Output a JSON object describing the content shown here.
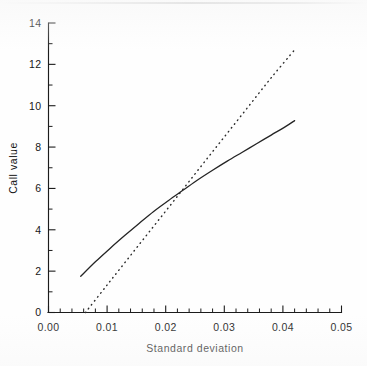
{
  "figure": {
    "background_color": "#fefefe",
    "ink_color": "#1c1c1c"
  },
  "chart_data": {
    "type": "line",
    "title": "",
    "xlabel": "Standard deviation",
    "ylabel": "Call value",
    "xlim": [
      0.0,
      0.05
    ],
    "ylim": [
      0,
      14
    ],
    "grid": false,
    "legend": "none",
    "x_major_ticks": [
      0.0,
      0.01,
      0.02,
      0.03,
      0.04,
      0.05
    ],
    "x_tick_labels": [
      "0.00",
      "0.01",
      "0.02",
      "0.03",
      "0.04",
      "0.05"
    ],
    "x_minor_ticks": [
      0.002,
      0.004,
      0.006,
      0.008,
      0.012,
      0.014,
      0.016,
      0.018,
      0.022,
      0.024,
      0.026,
      0.028,
      0.032,
      0.034,
      0.036,
      0.038,
      0.042,
      0.044,
      0.046,
      0.048
    ],
    "y_major_ticks": [
      0,
      2,
      4,
      6,
      8,
      10,
      12,
      14
    ],
    "y_tick_labels": [
      "0",
      "2",
      "4",
      "6",
      "8",
      "10",
      "12",
      "14"
    ],
    "y_minor_ticks": [
      1,
      3,
      5,
      7,
      9,
      11,
      13
    ],
    "series": [
      {
        "name": "solid-curve",
        "style": "solid",
        "color": "#242424",
        "x": [
          0.0055,
          0.008,
          0.0105,
          0.013,
          0.0155,
          0.018,
          0.0205,
          0.023,
          0.0255,
          0.028,
          0.0305,
          0.033,
          0.0355,
          0.038,
          0.0405,
          0.042
        ],
        "y": [
          1.75,
          2.45,
          3.1,
          3.72,
          4.32,
          4.9,
          5.42,
          5.92,
          6.42,
          6.88,
          7.32,
          7.74,
          8.16,
          8.58,
          9.0,
          9.28
        ]
      },
      {
        "name": "dotted-line",
        "style": "dotted",
        "color": "#2c2c2c",
        "x": [
          0.0063,
          0.01,
          0.014,
          0.018,
          0.022,
          0.026,
          0.03,
          0.034,
          0.038,
          0.042
        ],
        "y": [
          0.0,
          1.33,
          2.76,
          4.19,
          5.62,
          7.06,
          8.49,
          9.92,
          11.35,
          12.7
        ]
      }
    ],
    "annotations": [
      {
        "name": "crossing-point",
        "x": 0.0228,
        "y": 5.72,
        "note": "solid and dotted series intersect"
      }
    ]
  }
}
